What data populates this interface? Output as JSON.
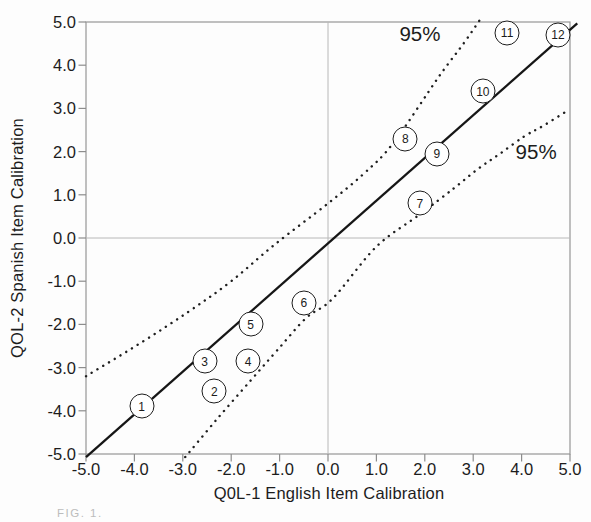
{
  "figure": {
    "caption_partial": "FIG. 1."
  },
  "chart_data": {
    "type": "scatter",
    "title": "",
    "xlabel": "Q0L-1 English Item Calibration",
    "ylabel": "QOL-2 Spanish Item Calibration",
    "xlim": [
      -5.0,
      5.0
    ],
    "ylim": [
      -5.0,
      5.0
    ],
    "grid_zero_lines": true,
    "x_tick_values": [
      -5,
      -4,
      -3,
      -2,
      -1,
      0,
      1,
      2,
      3,
      4,
      5
    ],
    "x_tick_labels": [
      "-5.0",
      "-4.0",
      "-3.0",
      "-2.0",
      "-1.0",
      "0.0",
      "1.0",
      "2.0",
      "3.0",
      "4.0",
      "5.0"
    ],
    "y_tick_values": [
      5,
      4,
      3,
      2,
      1,
      0,
      -1,
      -2,
      -3,
      -4,
      -5
    ],
    "y_tick_labels": [
      "5.0",
      "4.0",
      "3.0",
      "2.0",
      "1.0",
      "0.0",
      "-1.0",
      "-2.0",
      "-3.0",
      "-4.0",
      "-5.0"
    ],
    "points": [
      {
        "label": "1",
        "x": -3.85,
        "y": -3.9
      },
      {
        "label": "2",
        "x": -2.35,
        "y": -3.55
      },
      {
        "label": "3",
        "x": -2.55,
        "y": -2.85
      },
      {
        "label": "4",
        "x": -1.65,
        "y": -2.85
      },
      {
        "label": "5",
        "x": -1.6,
        "y": -2.0
      },
      {
        "label": "6",
        "x": -0.5,
        "y": -1.5
      },
      {
        "label": "7",
        "x": 1.9,
        "y": 0.8
      },
      {
        "label": "8",
        "x": 1.6,
        "y": 2.3
      },
      {
        "label": "9",
        "x": 2.25,
        "y": 1.95
      },
      {
        "label": "10",
        "x": 3.2,
        "y": 3.4
      },
      {
        "label": "11",
        "x": 3.7,
        "y": 4.75
      },
      {
        "label": "12",
        "x": 4.75,
        "y": 4.7
      }
    ],
    "identity_line": {
      "x1": -5.0,
      "y1": -5.07,
      "x2": 5.15,
      "y2": 4.97
    },
    "confidence_bands": {
      "level_label": "95%",
      "upper": [
        [
          -5.0,
          -3.2
        ],
        [
          -3.9,
          -2.45
        ],
        [
          -2.9,
          -1.72
        ],
        [
          -2.0,
          -1.0
        ],
        [
          -1.1,
          -0.15
        ],
        [
          0.0,
          0.8
        ],
        [
          0.75,
          1.5
        ],
        [
          1.35,
          2.2
        ],
        [
          2.3,
          3.75
        ],
        [
          2.8,
          4.5
        ],
        [
          3.15,
          5.07
        ]
      ],
      "lower": [
        [
          -2.95,
          -5.07
        ],
        [
          -2.3,
          -4.2
        ],
        [
          -1.6,
          -3.3
        ],
        [
          -1.05,
          -2.6
        ],
        [
          -0.45,
          -1.85
        ],
        [
          0.1,
          -1.4
        ],
        [
          1.0,
          -0.2
        ],
        [
          1.9,
          0.55
        ],
        [
          2.6,
          1.15
        ],
        [
          3.1,
          1.6
        ],
        [
          3.55,
          1.95
        ],
        [
          4.05,
          2.35
        ],
        [
          4.45,
          2.6
        ],
        [
          4.95,
          2.95
        ]
      ]
    },
    "annotations": [
      {
        "text": "95%",
        "x": 1.9,
        "y": 4.72
      },
      {
        "text": "95%",
        "x": 4.3,
        "y": 1.98
      }
    ]
  }
}
